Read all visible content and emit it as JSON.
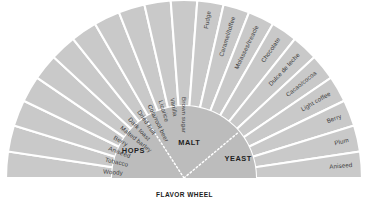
{
  "figure": {
    "caption": "FLAVOR WHEEL",
    "background_color": "#ffffff",
    "segment_color": "#c9c9c9",
    "hub_color": "#bcbcbc",
    "divider_color": "#ffffff",
    "label_color": "#3c3c3c",
    "hub_label_color": "#1f1f1f"
  },
  "chart_data": {
    "type": "pie",
    "title": "FLAVOR WHEEL",
    "subtitle": "",
    "xlabel": "",
    "ylabel": "",
    "layout": {
      "shape": "half-donut",
      "start_angle_deg": 180,
      "end_angle_deg": 360,
      "inner_radius_px": 72,
      "outer_radius_px": 178,
      "center_x_px": 184,
      "center_y_px": 178,
      "grid": false,
      "legend": "none",
      "segment_count": 21,
      "equal_slices": true
    },
    "categories": [
      "Woody",
      "Tobacco",
      "Aniseed",
      "Berry",
      "Malted barley",
      "Dark toast",
      "Dried fruit",
      "Cola/root beer",
      "Licorice",
      "Vanilla",
      "Brown sugar",
      "Fudge",
      "Caramel/toffee",
      "Molasses/treacle",
      "Chocolate",
      "Dulce de leche",
      "Cacao/cocoa",
      "Light coffee",
      "Berry",
      "Plum",
      "Aniseed"
    ],
    "values": [
      1,
      1,
      1,
      1,
      1,
      1,
      1,
      1,
      1,
      1,
      1,
      1,
      1,
      1,
      1,
      1,
      1,
      1,
      1,
      1,
      1
    ],
    "hub_groups": [
      {
        "label": "HOPS",
        "start_deg": 180,
        "end_deg": 237
      },
      {
        "label": "MALT",
        "start_deg": 237,
        "end_deg": 320
      },
      {
        "label": "YEAST",
        "start_deg": 320,
        "end_deg": 360
      }
    ]
  }
}
